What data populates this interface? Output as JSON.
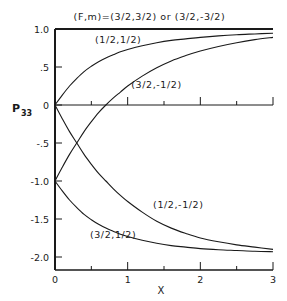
{
  "chart_data": {
    "type": "line",
    "title": "(F,m)=(3/2,3/2) or (3/2,-3/2)",
    "xlabel": "X",
    "ylabel": "P33",
    "xlim": [
      0,
      3
    ],
    "ylim": [
      -2.2,
      1.0
    ],
    "x_ticks": [
      0,
      1,
      2,
      3
    ],
    "x_tick_labels": [
      "0",
      "1",
      "2",
      "3"
    ],
    "x_minor_ticks": [
      0.5,
      1.5,
      2.5
    ],
    "y_ticks": [
      1.0,
      0.5,
      0,
      -0.5,
      -1.0,
      -1.5,
      -2.0
    ],
    "y_tick_labels": [
      "1.0",
      ".5",
      "0",
      "-.5",
      "-1.0",
      "-1.5",
      "-2.0"
    ],
    "grid": false,
    "legend": "inline labels",
    "x": [
      0,
      0.1,
      0.2,
      0.3,
      0.4,
      0.5,
      0.6,
      0.7,
      0.8,
      0.9,
      1.0,
      1.2,
      1.4,
      1.6,
      1.8,
      2.0,
      2.25,
      2.5,
      2.75,
      3.0
    ],
    "series": [
      {
        "name": "(3/2,3/2) or (3/2,-3/2)",
        "values": [
          1.0,
          1.0,
          1.0,
          1.0,
          1.0,
          1.0,
          1.0,
          1.0,
          1.0,
          1.0,
          1.0,
          1.0,
          1.0,
          1.0,
          1.0,
          1.0,
          1.0,
          1.0,
          1.0,
          1.0
        ]
      },
      {
        "name": "(1/2,1/2)",
        "values": [
          0,
          0.13,
          0.25,
          0.35,
          0.44,
          0.51,
          0.57,
          0.62,
          0.66,
          0.7,
          0.73,
          0.78,
          0.82,
          0.85,
          0.87,
          0.89,
          0.91,
          0.925,
          0.935,
          0.945
        ]
      },
      {
        "name": "(3/2,-1/2)",
        "values": [
          -1.0,
          -0.82,
          -0.65,
          -0.5,
          -0.35,
          -0.22,
          -0.1,
          0.0,
          0.09,
          0.17,
          0.25,
          0.38,
          0.49,
          0.58,
          0.65,
          0.71,
          0.77,
          0.82,
          0.86,
          0.89
        ]
      },
      {
        "name": "(1/2,-1/2)",
        "values": [
          0,
          -0.18,
          -0.35,
          -0.5,
          -0.65,
          -0.78,
          -0.9,
          -1.0,
          -1.1,
          -1.19,
          -1.27,
          -1.41,
          -1.53,
          -1.62,
          -1.69,
          -1.75,
          -1.8,
          -1.84,
          -1.87,
          -1.9
        ]
      },
      {
        "name": "(3/2,1/2)",
        "values": [
          -1.0,
          -1.13,
          -1.25,
          -1.35,
          -1.44,
          -1.51,
          -1.57,
          -1.62,
          -1.66,
          -1.7,
          -1.73,
          -1.78,
          -1.82,
          -1.85,
          -1.87,
          -1.89,
          -1.905,
          -1.915,
          -1.925,
          -1.93
        ]
      }
    ],
    "annotations": [
      {
        "text": "(F,m)=(3/2,3/2) or (3/2,-3/2)",
        "x": 1.3,
        "y": 1.12
      },
      {
        "text": "(1/2,1/2)",
        "x": 0.55,
        "y": 0.82
      },
      {
        "text": "(3/2,-1/2)",
        "x": 1.05,
        "y": 0.22
      },
      {
        "text": "(1/2,-1/2)",
        "x": 1.35,
        "y": -1.35
      },
      {
        "text": "(3/2,1/2)",
        "x": 0.48,
        "y": -1.75
      }
    ]
  },
  "labels": {
    "title": "(F,m)=(3/2,3/2) or (3/2,-3/2)",
    "ylabel_main": "P",
    "ylabel_sub": "33",
    "xlabel": "X"
  }
}
